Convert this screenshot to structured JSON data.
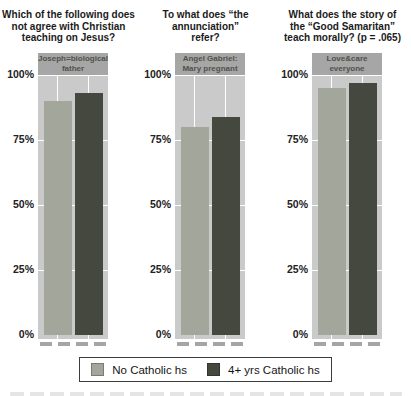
{
  "chart_data": {
    "type": "bar",
    "ylabel": "",
    "ylim": [
      0,
      100
    ],
    "y_ticks": [
      "100%",
      "75%",
      "50%",
      "25%",
      "0%"
    ],
    "grid": true,
    "legend_position": "bottom",
    "series": [
      {
        "name": "No Catholic hs",
        "color": "#a3a69b"
      },
      {
        "name": "4+ yrs Catholic hs",
        "color": "#45483f"
      }
    ],
    "charts": [
      {
        "title": "Which of the following does not agree with Christian teaching on Jesus?",
        "title_lines": [
          "Which of the following does",
          "not agree with Christian",
          "teaching on Jesus?"
        ],
        "category": "Joseph=biological father",
        "category_lines": [
          "Joseph=biological",
          "father"
        ],
        "values": [
          90,
          93
        ]
      },
      {
        "title": "To what does “the annunciation” refer?",
        "title_lines": [
          "To what does “the",
          "annunciation”",
          "refer?"
        ],
        "category": "Angel Gabriel: Mary pregnant",
        "category_lines": [
          "Angel Gabriel:",
          "Mary pregnant"
        ],
        "values": [
          80,
          84
        ]
      },
      {
        "title": "What does the story of the “Good Samaritan” teach morally? (p = .065)",
        "title_lines": [
          "What does the story of",
          "the “Good Samaritan”",
          "teach morally? (p = .065)"
        ],
        "category": "Love&care everyone",
        "category_lines": [
          "Love&care",
          "everyone"
        ],
        "values": [
          95,
          97
        ]
      }
    ]
  },
  "colors": {
    "plot_background": "#cacaca",
    "category_band": "#a6a6a6",
    "gridline": "#ffffff",
    "bar_light": "#a3a69b",
    "bar_dark": "#45483f"
  }
}
